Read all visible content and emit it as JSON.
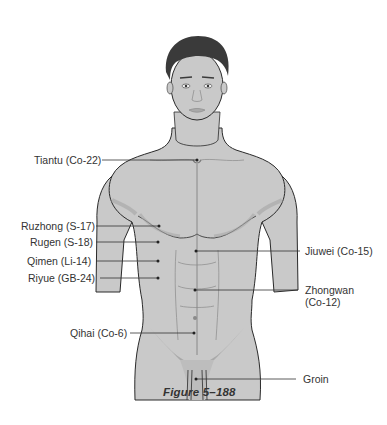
{
  "figure": {
    "caption": "Figure 5–188",
    "colors": {
      "skin": "#c9c9c9",
      "skin_shadow": "#a9a9a9",
      "hair": "#3a3a3a",
      "outline": "#2a2a2a",
      "leader_line": "#333333",
      "label_text": "#333333"
    }
  },
  "points": {
    "left": [
      {
        "label": "Tiantu (Co-22)",
        "dot": [
          197,
          160
        ]
      },
      {
        "label": "Ruzhong (S-17)",
        "dot": [
          159,
          226
        ]
      },
      {
        "label": "Rugen (S-18)",
        "dot": [
          158,
          242
        ]
      },
      {
        "label": "Qimen (Li-14)",
        "dot": [
          158,
          261
        ]
      },
      {
        "label": "Riyue (GB-24)",
        "dot": [
          158,
          278
        ]
      },
      {
        "label": "Qihai (Co-6)",
        "dot": [
          194,
          333
        ]
      }
    ],
    "right": [
      {
        "label": "Jiuwei (Co-15)",
        "dot": [
          196,
          251
        ]
      },
      {
        "label_line1": "Zhongwan",
        "label_line2": "(Co-12)",
        "dot": [
          195,
          290
        ]
      },
      {
        "label": "Groin",
        "dot": [
          196,
          379
        ]
      }
    ]
  }
}
